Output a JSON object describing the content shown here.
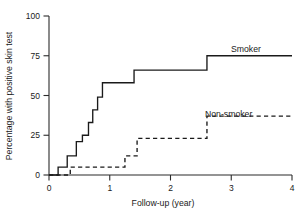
{
  "chart_data": {
    "type": "line",
    "title": "",
    "xlabel": "Follow-up (year)",
    "ylabel": "Percentage with positive skin test",
    "xlim": [
      0,
      4
    ],
    "ylim": [
      0,
      100
    ],
    "xticks": [
      "0",
      "1",
      "2",
      "3",
      "4"
    ],
    "yticks": [
      "0",
      "25",
      "50",
      "75",
      "100"
    ],
    "xtick_values": [
      0,
      1,
      2,
      3,
      4
    ],
    "ytick_values": [
      0,
      25,
      50,
      75,
      100
    ],
    "grid": false,
    "legend_position": "inline-right",
    "step_style": "post",
    "series": [
      {
        "name": "Smoker",
        "style": "solid",
        "label": "Smoker",
        "x": [
          0,
          0.15,
          0.3,
          0.45,
          0.55,
          0.65,
          0.72,
          0.8,
          0.88,
          1.4,
          2.6,
          4
        ],
        "y": [
          0,
          5,
          12,
          21,
          25,
          33,
          41,
          49,
          58,
          66,
          75,
          75
        ]
      },
      {
        "name": "Non-smoker",
        "style": "dashed",
        "label": "Non-smoker",
        "x": [
          0,
          0.35,
          1.25,
          1.45,
          2.6,
          4
        ],
        "y": [
          0,
          5,
          12,
          23,
          37,
          37
        ]
      }
    ],
    "annotations": [
      {
        "text": "Smoker",
        "x": 3.0,
        "y": 80
      },
      {
        "text": "Non-smoker",
        "x": 2.45,
        "y": 44
      }
    ]
  }
}
